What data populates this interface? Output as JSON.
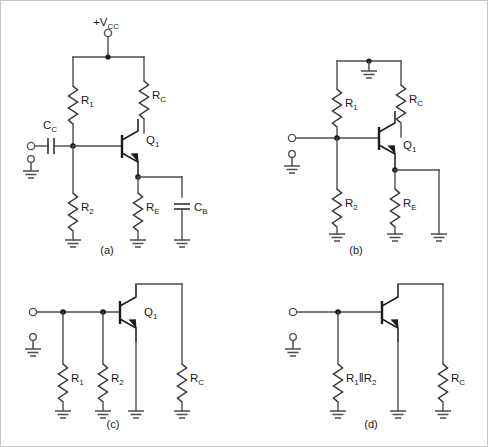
{
  "figure": {
    "background_color": "#ffffff",
    "wire_color": "#4d4d4d",
    "label_color": "#1a1a1a"
  },
  "panels": [
    {
      "id": "a",
      "caption": "(a)",
      "labels": {
        "supply": "+V",
        "supply_sub": "CC",
        "coupling_cap": "C",
        "coupling_cap_sub": "C",
        "r1": "R",
        "r1_sub": "1",
        "rc": "R",
        "rc_sub": "C",
        "r2": "R",
        "r2_sub": "2",
        "re": "R",
        "re_sub": "E",
        "cb": "C",
        "cb_sub": "B",
        "transistor": "Q",
        "transistor_sub": "1"
      }
    },
    {
      "id": "b",
      "caption": "(b)",
      "labels": {
        "r1": "R",
        "r1_sub": "1",
        "rc": "R",
        "rc_sub": "C",
        "r2": "R",
        "r2_sub": "2",
        "re": "R",
        "re_sub": "E",
        "transistor": "Q",
        "transistor_sub": "1"
      }
    },
    {
      "id": "c",
      "caption": "(c)",
      "labels": {
        "r1": "R",
        "r1_sub": "1",
        "r2": "R",
        "r2_sub": "2",
        "rc": "R",
        "rc_sub": "C",
        "transistor": "Q",
        "transistor_sub": "1"
      }
    },
    {
      "id": "d",
      "caption": "(d)",
      "labels": {
        "rpar_r1": "R",
        "rpar_r1_sub": "1",
        "rpar_sep": "‖",
        "rpar_r2": "R",
        "rpar_r2_sub": "2",
        "rc": "R",
        "rc_sub": "C"
      }
    }
  ]
}
